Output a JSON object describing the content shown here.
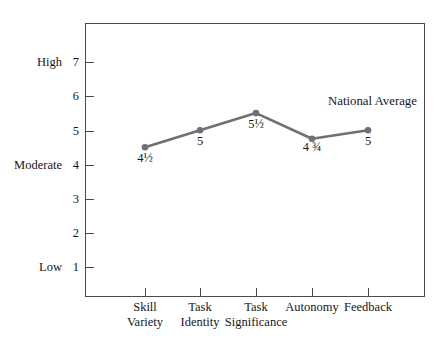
{
  "chart_data": {
    "type": "line",
    "title": "",
    "subtitle": "",
    "xlabel": "",
    "ylabel": "",
    "grid": false,
    "legend_position": "inline-annotation",
    "series_annotation": "National Average",
    "categories": [
      {
        "line1": "Skill",
        "line2": "Variety"
      },
      {
        "line1": "Task",
        "line2": "Identity"
      },
      {
        "line1": "Task",
        "line2": "Significance"
      },
      {
        "line1": "Autonomy",
        "line2": ""
      },
      {
        "line1": "Feedback",
        "line2": ""
      }
    ],
    "series": [
      {
        "name": "National Average",
        "values": [
          4.5,
          5,
          5.5,
          4.75,
          5
        ],
        "value_labels": [
          "4½",
          "5",
          "5½",
          "4 ¾",
          "5"
        ],
        "color": "#6f6f74"
      }
    ],
    "ylim": [
      0,
      7.6
    ],
    "yticks": [
      1,
      2,
      3,
      4,
      5,
      6,
      7
    ],
    "ytick_labels": [
      "1",
      "2",
      "3",
      "4",
      "5",
      "6",
      "7"
    ],
    "y_anchor_labels": [
      {
        "value": 7,
        "text": "High"
      },
      {
        "value": 4,
        "text": "Moderate"
      },
      {
        "value": 1,
        "text": "Low"
      }
    ]
  },
  "colors": {
    "series": "#6f6f74",
    "axis": "#4a4a4f",
    "text": "#16161a",
    "background": "#ffffff"
  }
}
